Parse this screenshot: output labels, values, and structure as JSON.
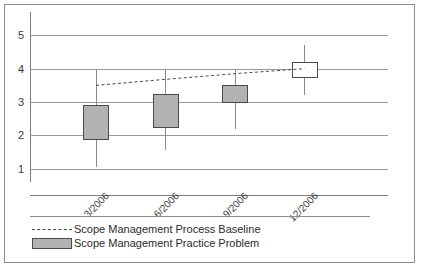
{
  "chart_data": {
    "type": "bar",
    "chart_style": "box-and-whisker with trend line",
    "title": "",
    "subtitle": "",
    "xlabel": "",
    "ylabel": "",
    "categories": [
      "3/2006",
      "6/2006",
      "9/2006",
      "12/2006"
    ],
    "ylim": [
      0.6,
      5.4
    ],
    "y_ticks": [
      1,
      2,
      3,
      4,
      5
    ],
    "y_tick_labels": [
      "1",
      "2",
      "3",
      "4",
      "5"
    ],
    "grid": true,
    "legend_position": "bottom-left",
    "series": [
      {
        "name": "Scope Management Practice Problem",
        "type": "box",
        "color": "#b2b2b2",
        "edge_color": "#4a4a4a",
        "boxes": [
          {
            "category": "3/2006",
            "box_low": 1.85,
            "box_high": 2.9,
            "whisker_low": 1.05,
            "whisker_high": 4.0,
            "filled": true
          },
          {
            "category": "6/2006",
            "box_low": 2.22,
            "box_high": 3.25,
            "whisker_low": 1.55,
            "whisker_high": 4.0,
            "filled": true
          },
          {
            "category": "9/2006",
            "box_low": 2.97,
            "box_high": 3.5,
            "whisker_low": 2.2,
            "whisker_high": 4.0,
            "filled": true
          },
          {
            "category": "12/2006",
            "box_low": 3.72,
            "box_high": 4.2,
            "whisker_low": 3.22,
            "whisker_high": 4.72,
            "filled": false
          }
        ]
      },
      {
        "name": "Scope Management Process Baseline",
        "type": "line",
        "style": "dashed",
        "color": "#4a4a4a",
        "values": [
          3.5,
          3.68,
          3.85,
          4.0
        ]
      }
    ]
  },
  "axes": {
    "y_tick_labels": [
      "5",
      "4",
      "3",
      "2",
      "1"
    ],
    "x_tick_labels": [
      "3/2006",
      "6/2006",
      "9/2006",
      "12/2006"
    ]
  },
  "legend": {
    "items": [
      {
        "key": "dashed-line",
        "label": "Scope Management Process Baseline"
      },
      {
        "key": "gray-swatch",
        "label": "Scope Management Practice Problem"
      }
    ]
  },
  "colors": {
    "box_fill": "#b2b2b2",
    "box_edge": "#4a4a4a",
    "gridline": "#9a9a9a",
    "axis": "#7d7d7d",
    "frame": "#8d8d8d",
    "text": "#2b2b2b",
    "background": "#ffffff"
  }
}
